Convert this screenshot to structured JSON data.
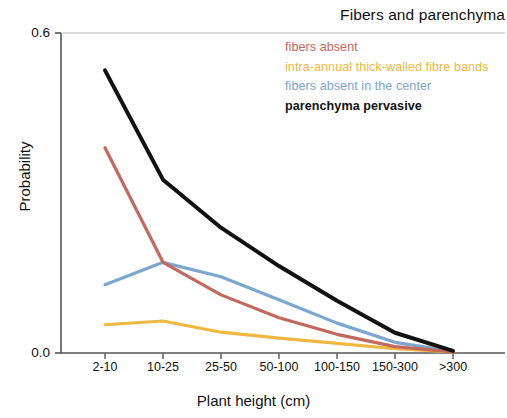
{
  "chart_data": {
    "type": "line",
    "title": "Fibers and parenchyma",
    "xlabel": "Plant height (cm)",
    "ylabel": "Probability",
    "categories": [
      "2-10",
      "10-25",
      "25-50",
      "50-100",
      "100-150",
      "150-300",
      ">300"
    ],
    "ylim": [
      0.0,
      0.6
    ],
    "yticks": [
      0.0,
      0.6
    ],
    "ytick_labels": [
      "0.0",
      "0.6"
    ],
    "grid": false,
    "legend_position": "top-right inside plot",
    "series": [
      {
        "name": "fibers absent",
        "color": "#c4685e",
        "values": [
          0.385,
          0.17,
          0.109,
          0.066,
          0.035,
          0.012,
          0.002
        ]
      },
      {
        "name": "intra-annual thick-walled fibre bands",
        "color": "#f0b840",
        "values": [
          0.053,
          0.06,
          0.039,
          0.028,
          0.018,
          0.008,
          0.002
        ]
      },
      {
        "name": "fibers absent in the center",
        "color": "#7aa6d0",
        "values": [
          0.128,
          0.17,
          0.143,
          0.1,
          0.056,
          0.02,
          0.003
        ]
      },
      {
        "name": "parenchyma pervasive",
        "color": "#111111",
        "values": [
          0.53,
          0.325,
          0.235,
          0.163,
          0.098,
          0.038,
          0.004
        ]
      }
    ]
  },
  "axis": {
    "ytick_top": "0.6",
    "ytick_bottom": "0.0"
  }
}
